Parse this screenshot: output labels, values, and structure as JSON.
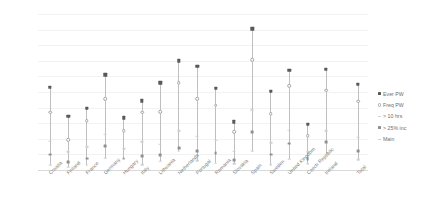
{
  "chart_data": {
    "type": "scatter",
    "title": "",
    "subtitle": "",
    "xlabel": "",
    "ylabel": "",
    "ylim": [
      0,
      20
    ],
    "yticks": [
      0,
      2,
      4,
      6,
      8,
      10,
      12,
      14,
      16,
      18,
      20
    ],
    "grid": true,
    "legend_position": "right",
    "categories": [
      "Croatia",
      "Finland",
      "France",
      "Germany",
      "Hungary",
      "Italy",
      "Lithuania",
      "Netherlands",
      "Portugal",
      "Romania",
      "Slovakia",
      "Spain",
      "Sweden",
      "United Kingdom",
      "Czech Republic",
      "Ireland",
      "Total"
    ],
    "series": [
      {
        "name": "Ever PW",
        "marker": "filled-square",
        "color": "#595959",
        "values": [
          10.6,
          6.9,
          7.9,
          12.2,
          6.7,
          8.9,
          11.2,
          14.0,
          13.3,
          10.5,
          6.2,
          18.1,
          10.1,
          12.8,
          5.9,
          12.9,
          11.0
        ]
      },
      {
        "name": "Freq PW",
        "marker": "open-circle",
        "color": "#a6a6a6",
        "values": [
          7.4,
          3.9,
          6.3,
          9.1,
          5.0,
          7.4,
          7.5,
          11.2,
          9.1,
          8.3,
          4.9,
          14.1,
          7.2,
          10.8,
          4.4,
          10.2,
          8.8
        ]
      },
      {
        "name": "> 10 hrs",
        "marker": "small-tick",
        "color": "#d0d0d0",
        "values": [
          3.7,
          2.3,
          3.0,
          4.6,
          2.7,
          3.6,
          3.3,
          5.0,
          4.3,
          3.8,
          2.4,
          7.7,
          3.5,
          5.1,
          2.3,
          5.0,
          4.2
        ]
      },
      {
        "name": "> 25% inc",
        "marker": "mid-dot",
        "color": "#909090",
        "values": [
          2.0,
          1.0,
          1.5,
          3.1,
          1.5,
          1.8,
          1.9,
          2.8,
          2.5,
          2.2,
          1.3,
          4.9,
          2.0,
          3.4,
          1.4,
          3.6,
          2.5
        ]
      },
      {
        "name": "Main",
        "marker": "faint-dash",
        "color": "#cfcfcf",
        "values": [
          0.6,
          0.4,
          0.6,
          1.5,
          1.4,
          0.7,
          1.1,
          2.4,
          1.2,
          0.9,
          0.8,
          2.4,
          0.7,
          1.4,
          0.8,
          2.0,
          1.3
        ]
      }
    ]
  }
}
